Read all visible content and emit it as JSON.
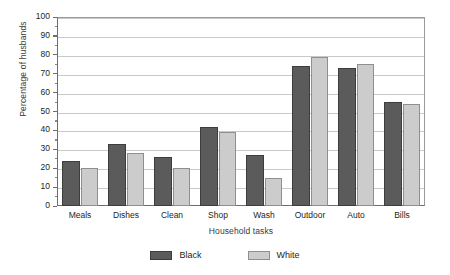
{
  "chart_data": {
    "type": "bar",
    "title": "",
    "xlabel": "Household tasks",
    "ylabel": "Percentage of husbands",
    "ylim": [
      0,
      100
    ],
    "ytick_step": 10,
    "yticks": [
      0,
      10,
      20,
      30,
      40,
      50,
      60,
      70,
      80,
      90,
      100
    ],
    "grid": true,
    "legend_position": "bottom-center",
    "categories": [
      "Meals",
      "Dishes",
      "Clean",
      "Shop",
      "Wash",
      "Outdoor",
      "Auto",
      "Bills"
    ],
    "series": [
      {
        "name": "Black",
        "color": "#5b5b5b",
        "values": [
          24,
          33,
          26,
          42,
          27,
          74,
          73,
          55
        ]
      },
      {
        "name": "White",
        "color": "#cccccc",
        "values": [
          20,
          28,
          20,
          39,
          15,
          79,
          75,
          54
        ]
      }
    ]
  },
  "legend": {
    "items": [
      {
        "label": "Black"
      },
      {
        "label": "White"
      }
    ]
  }
}
